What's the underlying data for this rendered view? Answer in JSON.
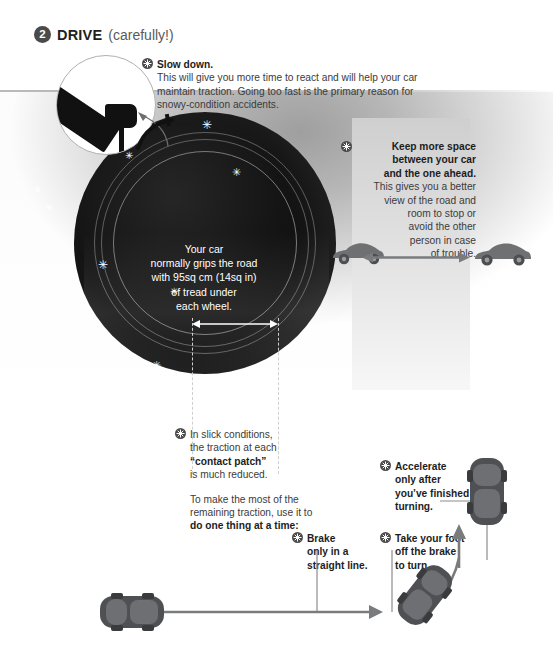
{
  "header": {
    "step_number": "2",
    "title": "DRIVE",
    "subtitle": "(carefully!)"
  },
  "colors": {
    "ink": "#231f20",
    "body_text": "#3b3b3b",
    "bullet": "#4a4a4a",
    "tire_black": "#111111",
    "car_gray": "#6f7072",
    "arrow_gray": "#7a7b7d",
    "snow_white": "#ffffff",
    "panel_gray": "#d4d4d4"
  },
  "callouts": {
    "slow_down": {
      "icon": "snowflake-bullet-icon",
      "heading": "Slow down.",
      "body": "This will give you more time to react and will help your car maintain traction. Going too fast is the primary reason for snowy-condition accidents."
    },
    "keep_space": {
      "icon": "snowflake-bullet-icon",
      "heading_line1": "Keep more space",
      "heading_line2": "between your car",
      "heading_line3": "and the one ahead.",
      "body_line1": "This gives you a better",
      "body_line2": "view of the road and",
      "body_line3": "room to stop or",
      "body_line4": "avoid the other",
      "body_line5": "person in case",
      "body_line6": "of trouble."
    },
    "contact_patch": {
      "icon": "snowflake-bullet-icon",
      "line1": "In slick conditions,",
      "line2": "the traction at each",
      "emphasis": "“contact patch”",
      "line3": "is much reduced.",
      "para2_line1": "To make the most of the",
      "para2_line2": "remaining traction, use it to",
      "para2_bold": "do one thing at a time:"
    },
    "brake": {
      "icon": "snowflake-bullet-icon",
      "line1": "Brake",
      "line2": "only in a",
      "line3": "straight line."
    },
    "take_foot_off": {
      "icon": "snowflake-bullet-icon",
      "line1": "Take your foot",
      "line2": "off the brake",
      "line3": "to turn."
    },
    "accelerate": {
      "icon": "snowflake-bullet-icon",
      "line1": "Accelerate",
      "line2": "only after",
      "line3": "you’ve finished",
      "line4": "turning."
    }
  },
  "tire_label": {
    "line1": "Your car",
    "line2": "normally grips the road",
    "line3": "with 95sq cm (14sq in)",
    "line4": "of tread under",
    "line5": "each wheel."
  },
  "figures": {
    "magnifier": "magnified-pedal-icon",
    "tire": "tire-cross-section",
    "contact_patch_arrow": "contact-patch-width-arrow",
    "gap_arrow": "following-distance-arrow",
    "car_ahead": "car-side-view-ahead",
    "car_behind": "car-side-view-behind",
    "car_straight": "car-top-view-straight",
    "car_turning": "car-top-view-turning",
    "car_finished_turn": "car-top-view-finished-turn",
    "path_arrow": "driving-path-arrow"
  },
  "snowflakes": {
    "glyph": "✳",
    "count_on_tire": 6,
    "count_on_background": 4
  }
}
